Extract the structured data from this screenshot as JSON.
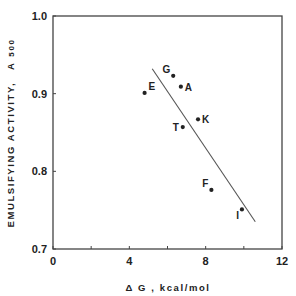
{
  "chart_data": {
    "type": "scatter",
    "title": "",
    "xlabel": "Δ G , kcal/mol",
    "ylabel": "EMULSIFYING ACTIVITY, A500",
    "ylabel_main": "EMULSIFYING ACTIVITY,",
    "ylabel_symbol": "A",
    "ylabel_subscript": "500",
    "xlim": [
      0,
      12
    ],
    "ylim": [
      0.7,
      1.0
    ],
    "x_ticks": [
      0,
      4,
      8,
      12
    ],
    "x_tick_labels": [
      "0",
      "4",
      "8",
      "12"
    ],
    "x_minor_ticks": [
      2,
      6,
      10
    ],
    "y_ticks": [
      0.7,
      0.8,
      0.9,
      1.0
    ],
    "y_tick_labels": [
      "0.7",
      "0.8",
      "0.9",
      "1.0"
    ],
    "grid": false,
    "legend": null,
    "points": [
      {
        "label": "E",
        "x": 4.8,
        "y": 0.901
      },
      {
        "label": "G",
        "x": 6.3,
        "y": 0.923
      },
      {
        "label": "A",
        "x": 6.7,
        "y": 0.909
      },
      {
        "label": "K",
        "x": 7.6,
        "y": 0.867
      },
      {
        "label": "T",
        "x": 6.8,
        "y": 0.857
      },
      {
        "label": "F",
        "x": 8.3,
        "y": 0.776
      },
      {
        "label": "I",
        "x": 9.9,
        "y": 0.751
      }
    ],
    "fit_line": {
      "x": [
        5.2,
        10.6
      ],
      "y": [
        0.932,
        0.735
      ]
    }
  },
  "colors": {
    "ink": "#222222",
    "line": "#555555",
    "background": "#ffffff"
  }
}
